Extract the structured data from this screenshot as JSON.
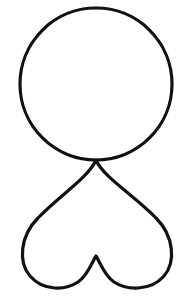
{
  "figure": {
    "stroke_color": "#111111",
    "background": "#ffffff",
    "shapes": [
      {
        "name": "circle",
        "cx": 96,
        "cy": 84,
        "r": 76
      },
      {
        "name": "inverted-heart",
        "top_point": [
          96,
          160
        ],
        "bottom_cusp": [
          96,
          256
        ],
        "width_span": [
          22,
          172
        ]
      }
    ]
  }
}
